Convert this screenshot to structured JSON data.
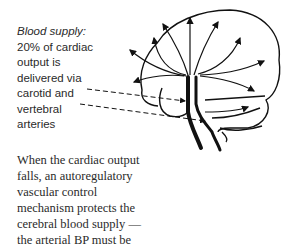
{
  "figure": {
    "name": "brain-blood-supply-diagram",
    "caption": {
      "title": "Blood supply:",
      "lines": [
        "20% of cardiac",
        "output is",
        "delivered via",
        "carotid and",
        "vertebral",
        "arteries"
      ]
    }
  },
  "body_text": {
    "lines": [
      "When the cardiac output",
      "falls, an autoregulatory",
      "vascular control",
      "mechanism protects the",
      "cerebral blood supply —",
      "the arterial BP must be"
    ]
  }
}
